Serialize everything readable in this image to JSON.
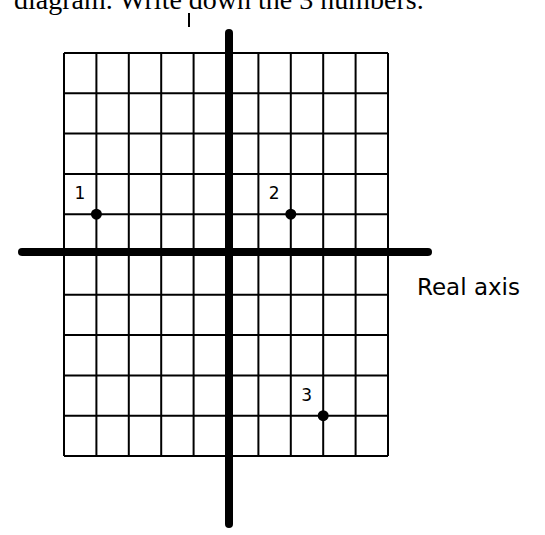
{
  "caption": "diagram. Write down the 3 numbers.",
  "axes": {
    "real_label": "Real axis",
    "imag_label_fragment": "I"
  },
  "grid": {
    "columns": 10,
    "rows": 10,
    "left": 64,
    "top": 53,
    "cell_width": 32.4,
    "cell_height": 40.3,
    "real_axis_grid_line": 5,
    "imag_axis_grid_line": 5,
    "line_color": "#000000",
    "axis_color": "#000000"
  },
  "points": [
    {
      "label": "1",
      "col": 1,
      "row": 4,
      "re": -4,
      "im": 1
    },
    {
      "label": "2",
      "col": 7,
      "row": 4,
      "re": 2,
      "im": 1
    },
    {
      "label": "3",
      "col": 8,
      "row": 9,
      "re": 3,
      "im": -4
    }
  ]
}
